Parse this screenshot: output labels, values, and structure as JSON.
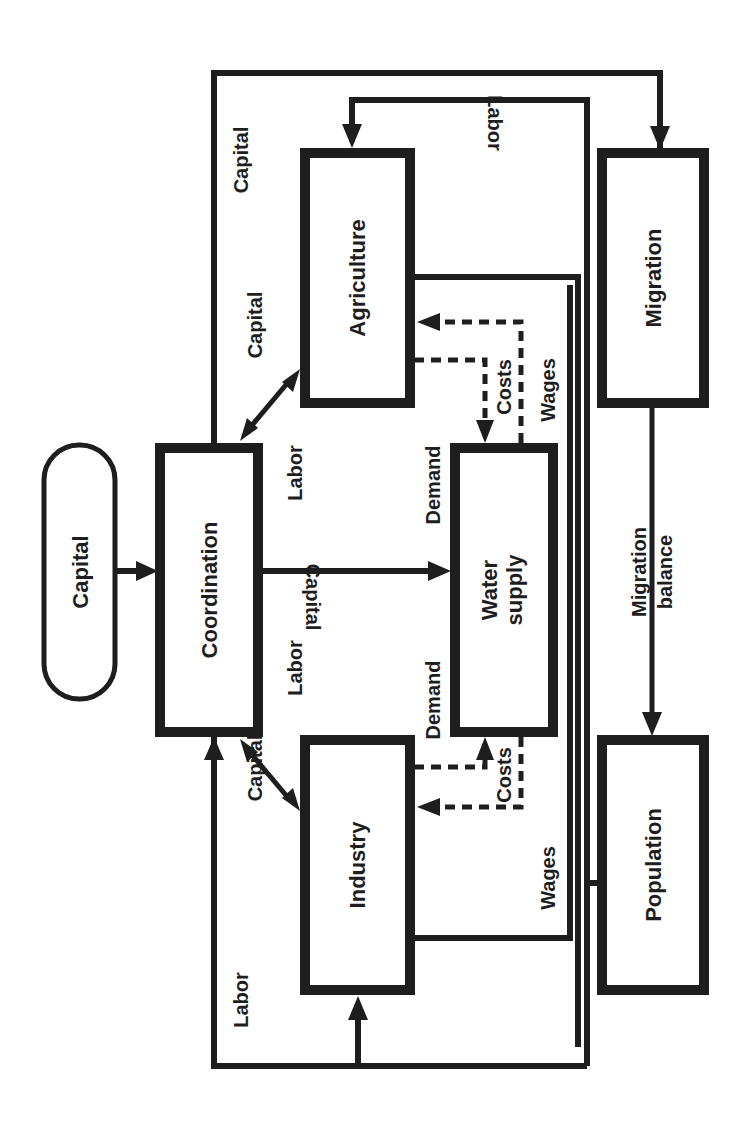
{
  "diagram": {
    "orientation": "rotated 90 degrees counter-clockwise",
    "colors": {
      "ink": "#1e1e1e",
      "background": "#ffffff"
    },
    "nodes": {
      "capital_source": {
        "label": "Capital",
        "shape": "pill"
      },
      "coordination": {
        "label": "Coordination",
        "shape": "box"
      },
      "agriculture": {
        "label": "Agriculture",
        "shape": "box"
      },
      "water_supply": {
        "label_line1": "Water",
        "label_line2": "supply",
        "shape": "box"
      },
      "industry": {
        "label": "Industry",
        "shape": "box"
      },
      "migration": {
        "label": "Migration",
        "shape": "box"
      },
      "population": {
        "label": "Population",
        "shape": "box"
      }
    },
    "edge_labels": {
      "outer_capital_top": "Capital",
      "outer_labor_bottom": "Labor",
      "labor_to_agriculture": "Labor",
      "coord_agri_capital": "Capital",
      "coord_agri_labor": "Labor",
      "coord_industry_capital": "Capital",
      "coord_industry_labor": "Labor",
      "coord_water_capital": "Capital",
      "agri_demand": "Demand",
      "agri_costs": "Costs",
      "agri_wages": "Wages",
      "industry_demand": "Demand",
      "industry_costs": "Costs",
      "industry_wages": "Wages",
      "migration_balance_line1": "Migration",
      "migration_balance_line2": "balance"
    },
    "edges": [
      {
        "from": "capital_source",
        "to": "coordination",
        "label": ""
      },
      {
        "from": "coordination",
        "to": "water_supply",
        "label": "Capital"
      },
      {
        "from": "coordination",
        "to": "agriculture",
        "label": "Capital / Labor",
        "bidirectional": true
      },
      {
        "from": "coordination",
        "to": "industry",
        "label": "Capital / Labor",
        "bidirectional": true
      },
      {
        "from": "agriculture",
        "to": "water_supply",
        "label": "Demand",
        "style": "dashed"
      },
      {
        "from": "water_supply",
        "to": "agriculture",
        "label": "Costs",
        "style": "dashed"
      },
      {
        "from": "industry",
        "to": "water_supply",
        "label": "Demand",
        "style": "dashed"
      },
      {
        "from": "water_supply",
        "to": "industry",
        "label": "Costs",
        "style": "dashed"
      },
      {
        "from": "agriculture",
        "to": "population",
        "label": "Wages"
      },
      {
        "from": "industry",
        "to": "population",
        "label": "Wages"
      },
      {
        "from": "population",
        "to": "agriculture",
        "label": "Labor"
      },
      {
        "from": "population",
        "to": "industry",
        "label": "Labor"
      },
      {
        "from": "outer_loop",
        "to": "coordination",
        "label": "Labor / Capital"
      },
      {
        "from": "outer_loop",
        "to": "migration",
        "label": "Capital"
      },
      {
        "from": "migration",
        "to": "population",
        "label": "Migration balance"
      }
    ]
  }
}
